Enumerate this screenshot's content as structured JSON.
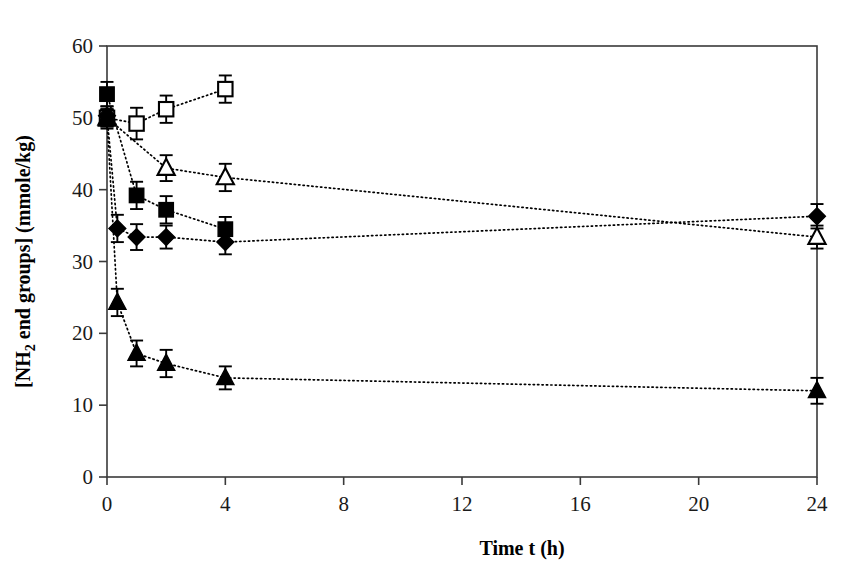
{
  "chart_data": {
    "type": "scatter",
    "title": "",
    "xlabel": "Time t (h)",
    "ylabel": "[NH2 end groups] (mmole/kg)",
    "ylabel_prefix": "[NH",
    "ylabel_sub": "2",
    "ylabel_suffix": " end groups] (mmole/kg)",
    "xlim": [
      0,
      24
    ],
    "ylim": [
      0,
      60
    ],
    "xticks": [
      0,
      4,
      8,
      12,
      16,
      20,
      24
    ],
    "xtick_labels": [
      "0",
      "4",
      "8",
      "12",
      "16",
      "20",
      "24"
    ],
    "yticks": [
      0,
      10,
      20,
      30,
      40,
      50,
      60
    ],
    "ytick_labels": [
      "0",
      "10",
      "20",
      "30",
      "40",
      "50",
      "60"
    ],
    "grid": false,
    "legend": "none",
    "line_style": "dotted",
    "series": [
      {
        "name": "open-square",
        "marker": "open-square",
        "x": [
          0,
          1,
          2,
          4
        ],
        "values": [
          50.0,
          49.2,
          51.2,
          54.0
        ],
        "yerr": [
          1.2,
          2.2,
          1.9,
          1.9
        ]
      },
      {
        "name": "open-triangle",
        "marker": "open-triangle",
        "x": [
          0,
          2,
          4,
          24
        ],
        "values": [
          50.0,
          43.0,
          41.7,
          33.4
        ],
        "yerr": [
          1.2,
          1.8,
          1.9,
          1.6
        ]
      },
      {
        "name": "filled-square",
        "marker": "filled-square",
        "x": [
          0,
          1,
          2,
          4
        ],
        "values": [
          53.3,
          39.2,
          37.2,
          34.5
        ],
        "yerr": [
          1.7,
          1.9,
          1.9,
          1.7
        ]
      },
      {
        "name": "filled-diamond",
        "marker": "filled-diamond",
        "x": [
          0,
          0.35,
          1,
          2,
          4,
          24
        ],
        "values": [
          50.3,
          34.6,
          33.4,
          33.4,
          32.7,
          36.3
        ],
        "yerr": [
          1.3,
          1.9,
          1.8,
          1.6,
          1.7,
          1.7
        ]
      },
      {
        "name": "filled-triangle",
        "marker": "filled-triangle",
        "x": [
          0,
          0.35,
          1,
          2,
          4,
          24
        ],
        "values": [
          49.8,
          24.3,
          17.2,
          15.8,
          13.8,
          12.0
        ],
        "yerr": [
          1.3,
          1.9,
          1.8,
          1.9,
          1.6,
          1.8
        ]
      }
    ]
  },
  "colors": {
    "ink": "#000000",
    "axis": "#3a3a3a",
    "background": "#ffffff"
  }
}
